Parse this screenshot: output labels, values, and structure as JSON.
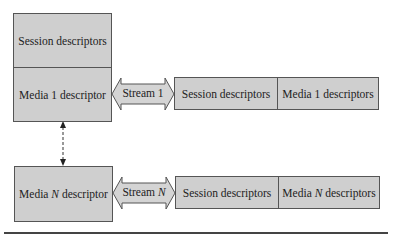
{
  "left_column": {
    "session_box": {
      "label": "Session descriptors"
    },
    "media1_box": {
      "label": "Media 1 descriptor"
    },
    "mediaN_box": {
      "label_pre": "Media ",
      "label_var": "N",
      "label_post": " descriptor"
    }
  },
  "streams": [
    {
      "label_pre": "Stream ",
      "label_var": "1"
    },
    {
      "label_pre": "Stream ",
      "label_var": "N"
    }
  ],
  "right_rows": [
    {
      "session": "Session descriptors",
      "media_pre": "Media ",
      "media_var": "1",
      "media_post": " descriptors"
    },
    {
      "session": "Session descriptors",
      "media_pre": "Media ",
      "media_var": "N",
      "media_post": " descriptors"
    }
  ],
  "colors": {
    "box_fill": "#cfcfcf",
    "border": "#555555",
    "rule": "#444444"
  }
}
